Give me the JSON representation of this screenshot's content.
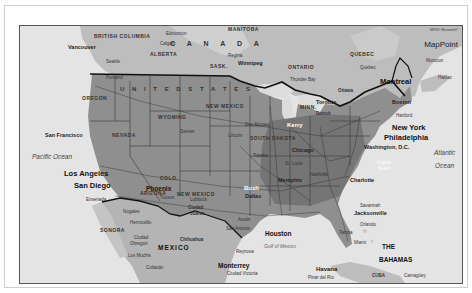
{
  "map": {
    "logo": {
      "superscript": "MSN® Microsoft®",
      "name": "MapPoint"
    },
    "countries": [
      {
        "id": "canada",
        "label": "C A N A D A"
      },
      {
        "id": "usa",
        "label": "U N I T E D   S T A T E S"
      },
      {
        "id": "mexico",
        "label": "MEXICO"
      },
      {
        "id": "bahamas_1",
        "label": "THE"
      },
      {
        "id": "bahamas_2",
        "label": "BAHAMAS"
      },
      {
        "id": "cuba",
        "label": "CUBA"
      }
    ],
    "regions": [
      "BRITISH COLUMBIA",
      "ALBERTA",
      "SASK.",
      "MANITOBA",
      "ONTARIO",
      "QUEBEC",
      "N.B.",
      "OREGON",
      "NEVADA",
      "CALIFORNIA",
      "IDAHO",
      "MONT.",
      "WYOMING",
      "UTAH",
      "COLO.",
      "ARIZONA",
      "NEW MEXICO",
      "N.DAK.",
      "SOUTH DAKOTA",
      "NEBR.",
      "KANSAS",
      "OKLA.",
      "TEXAS",
      "MINN.",
      "IOWA",
      "MO.",
      "ARK.",
      "LOUISIANA",
      "WIS.",
      "MICHIGAN",
      "ILL.",
      "IND.",
      "OHIO",
      "KY.",
      "TENN.",
      "MISS.",
      "ALA.",
      "GA.",
      "FLA.",
      "S.C.",
      "N.C.",
      "VA.",
      "W.VA.",
      "PA.",
      "N.Y.",
      "SONORA",
      "CHIHUAHUA",
      "DURANGO",
      "COAHUILA"
    ],
    "cities": {
      "vancouver": "Vancouver",
      "seattle": "Seattle",
      "portland": "Portland",
      "edmonton": "Edmonton",
      "calgary": "Calgary",
      "regina": "Regina",
      "winnipeg": "Winnipeg",
      "thunder_bay": "Thunder Bay",
      "quebec": "Quebec",
      "montreal": "Montreal",
      "ottawa": "Ottawa",
      "moncton": "Moncton",
      "halifax": "Halifax",
      "toronto": "Toronto",
      "detroit": "Detroit",
      "boston": "Boston",
      "hartford": "Hartford",
      "new_york": "New York",
      "philadelphia": "Philadelphia",
      "washington": "Washington, D.C.",
      "virginia_beach_1": "Virginia",
      "virginia_beach_2": "Beach",
      "charlotte": "Charlotte",
      "atlanta": "Atlanta",
      "savannah": "Savannah",
      "jacksonville": "Jacksonville",
      "orlando": "Orlando",
      "miami": "Miami",
      "tampa": "Tampa",
      "san_francisco": "San Francisco",
      "los_angeles": "Los Angeles",
      "san_diego": "San Diego",
      "ensenada": "Ensenada",
      "phoenix": "Phoenix",
      "tucson": "Tucson",
      "nogales": "Nogales",
      "hermosillo": "Hermosillo",
      "ciudad_obregon_1": "Ciudad",
      "ciudad_obregon_2": "Obregon",
      "los_mochis": "Los Mochis",
      "culiacan": "Culiacán",
      "chihuahua": "Chihuahua",
      "ciudad_juarez_1": "Ciudad",
      "ciudad_juarez_2": "Juárez",
      "lubbock": "Lubbock",
      "denver": "Denver",
      "des_moines": "Des Moines",
      "lincoln": "Lincoln",
      "topeka": "Topeka",
      "chicago": "Chicago",
      "kerry": "Kerry",
      "bush": "Bush",
      "dallas": "Dallas",
      "memphis": "Memphis",
      "nashville": "Nashville",
      "st_louis": "St. Louis",
      "houston": "Houston",
      "austin": "Austin",
      "san_antonio": "San Antonio",
      "monterrey": "Monterrey",
      "reynosa": "Reynosa",
      "ciudad_victoria": "Ciudad Victoria",
      "durango": "Durango",
      "torreon": "Torreón",
      "havana": "Havana",
      "pinar_del_rio": "Pinar del Río",
      "camaguey": "Camagüey"
    },
    "water": {
      "pacific_ocean": "Pacific Ocean",
      "atlantic_1": "Atlantic",
      "atlantic_2": "Ocean",
      "gulf_of_mexico": "Gulf of Mexico"
    },
    "colors": {
      "water": "#e4e4e4",
      "land_foreign": "#b9b9b9",
      "land_usa": "#8e8e8e",
      "east_dense": "#6f6f6f",
      "border": "#1a1a1a",
      "frame": "#555555"
    }
  }
}
